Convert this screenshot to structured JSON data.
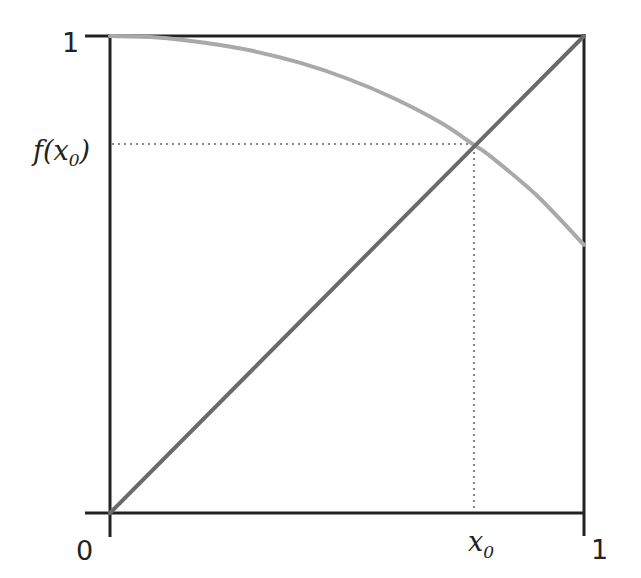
{
  "chart_data": {
    "type": "line",
    "title": "",
    "xlabel": "",
    "ylabel": "",
    "xlim": [
      0,
      1
    ],
    "ylim": [
      0,
      1
    ],
    "grid": false,
    "legend": null,
    "x_ticks": [
      {
        "value": 0,
        "label": "0"
      },
      {
        "value": 0.77,
        "label": "x0",
        "base": "x",
        "sub": "0"
      },
      {
        "value": 1,
        "label": "1"
      }
    ],
    "y_ticks": [
      {
        "value": 1,
        "label": "1"
      },
      {
        "value": 0.77,
        "label": "f(x0)",
        "base": "f(x",
        "sub": "0",
        "close": ")"
      }
    ],
    "series": [
      {
        "name": "f(x)",
        "description": "decreasing concave curve from (0,1) to (1,~0.56)",
        "color": "#a9a9a9",
        "x": [
          0,
          0.1,
          0.2,
          0.3,
          0.4,
          0.5,
          0.6,
          0.7,
          0.77,
          0.8,
          0.9,
          1.0
        ],
        "y": [
          1.0,
          0.997,
          0.986,
          0.969,
          0.944,
          0.911,
          0.869,
          0.817,
          0.77,
          0.75,
          0.666,
          0.562
        ]
      },
      {
        "name": "y = x",
        "description": "diagonal identity line",
        "color": "#6a6a6a",
        "x": [
          0,
          1
        ],
        "y": [
          0,
          1
        ]
      }
    ],
    "annotations": [
      {
        "type": "fixed-point",
        "x": 0.77,
        "y": 0.77,
        "label": "intersection of f(x) and y=x"
      },
      {
        "type": "dotted-guide",
        "from": [
          0,
          0.77
        ],
        "to": [
          0.77,
          0.77
        ],
        "color": "#8a8a8a"
      },
      {
        "type": "dotted-guide",
        "from": [
          0.77,
          0.77
        ],
        "to": [
          0.77,
          0
        ],
        "color": "#8a8a8a"
      }
    ]
  },
  "labels": {
    "y_top": "1",
    "y_fx0_base": "f(x",
    "y_fx0_sub": "0",
    "y_fx0_close": ")",
    "x_origin": "0",
    "x_x0_base": "x",
    "x_x0_sub": "0",
    "x_right": "1"
  },
  "colors": {
    "axis": "#222222",
    "curve": "#a9a9a9",
    "diagonal": "#6a6a6a",
    "guide": "#8a8a8a"
  }
}
